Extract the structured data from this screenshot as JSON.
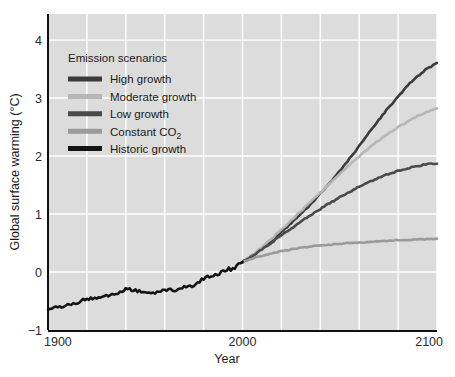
{
  "chart_data": {
    "type": "line",
    "title": "",
    "xlabel": "Year",
    "ylabel": "Global surface warming (°C)",
    "xlim": [
      1900,
      2100
    ],
    "ylim": [
      -1,
      4.45
    ],
    "xticks": [
      1900,
      2000,
      2100
    ],
    "xtick_labels": [
      "1900",
      "2000",
      "2100"
    ],
    "yticks": [
      -1,
      0,
      1,
      2,
      3,
      4
    ],
    "ytick_labels": [
      "−1",
      "0",
      "1",
      "2",
      "3",
      "4"
    ],
    "grid": true,
    "grid_x_step": 20,
    "grid_color": "#ffffff",
    "plot_background": "#dcdcdc",
    "legend_position": "upper-left-inside",
    "legend_title": "Emission scenarios",
    "series": [
      {
        "name": "High growth",
        "color": "#3b3b3b",
        "x_start": 2000,
        "x_end": 2100,
        "end_value": 3.6,
        "x": [
          2000,
          2005,
          2010,
          2015,
          2020,
          2025,
          2030,
          2035,
          2040,
          2045,
          2050,
          2055,
          2060,
          2065,
          2070,
          2075,
          2080,
          2085,
          2090,
          2095,
          2100
        ],
        "values": [
          0.17,
          0.28,
          0.41,
          0.55,
          0.69,
          0.84,
          1.0,
          1.17,
          1.35,
          1.54,
          1.74,
          1.95,
          2.17,
          2.4,
          2.62,
          2.83,
          3.03,
          3.22,
          3.38,
          3.51,
          3.6
        ]
      },
      {
        "name": "Moderate growth",
        "color": "#b6b6b6",
        "x_start": 2000,
        "x_end": 2100,
        "end_value": 2.82,
        "x": [
          2000,
          2005,
          2010,
          2015,
          2020,
          2025,
          2030,
          2035,
          2040,
          2045,
          2050,
          2055,
          2060,
          2065,
          2070,
          2075,
          2080,
          2085,
          2090,
          2095,
          2100
        ],
        "values": [
          0.17,
          0.29,
          0.43,
          0.58,
          0.73,
          0.89,
          1.05,
          1.21,
          1.37,
          1.53,
          1.69,
          1.85,
          2.0,
          2.14,
          2.27,
          2.39,
          2.5,
          2.6,
          2.69,
          2.76,
          2.82
        ]
      },
      {
        "name": "Low growth",
        "color": "#4a4a4a",
        "x_start": 2000,
        "x_end": 2100,
        "end_value": 1.87,
        "x": [
          2000,
          2005,
          2010,
          2015,
          2020,
          2025,
          2030,
          2035,
          2040,
          2045,
          2050,
          2055,
          2060,
          2065,
          2070,
          2075,
          2080,
          2085,
          2090,
          2095,
          2100
        ],
        "values": [
          0.17,
          0.27,
          0.39,
          0.51,
          0.63,
          0.75,
          0.87,
          0.98,
          1.09,
          1.19,
          1.29,
          1.38,
          1.47,
          1.55,
          1.62,
          1.69,
          1.74,
          1.79,
          1.83,
          1.86,
          1.87
        ]
      },
      {
        "name": "Constant CO2",
        "name_display": "Constant CO",
        "subscript": "2",
        "color": "#9a9a9a",
        "x_start": 2000,
        "x_end": 2100,
        "end_value": 0.57,
        "x": [
          2000,
          2005,
          2010,
          2015,
          2020,
          2025,
          2030,
          2035,
          2040,
          2045,
          2050,
          2055,
          2060,
          2065,
          2070,
          2075,
          2080,
          2085,
          2090,
          2095,
          2100
        ],
        "values": [
          0.17,
          0.23,
          0.28,
          0.32,
          0.36,
          0.39,
          0.42,
          0.44,
          0.46,
          0.47,
          0.49,
          0.5,
          0.51,
          0.52,
          0.53,
          0.54,
          0.55,
          0.55,
          0.56,
          0.57,
          0.57
        ]
      },
      {
        "name": "Historic growth",
        "color": "#141414",
        "x_start": 1900,
        "x_end": 2000,
        "end_value": 0.17,
        "x": [
          1900,
          1905,
          1910,
          1915,
          1920,
          1925,
          1930,
          1935,
          1940,
          1945,
          1950,
          1955,
          1960,
          1965,
          1970,
          1975,
          1980,
          1985,
          1990,
          1995,
          2000
        ],
        "values": [
          -0.64,
          -0.6,
          -0.58,
          -0.52,
          -0.48,
          -0.45,
          -0.4,
          -0.38,
          -0.3,
          -0.32,
          -0.34,
          -0.35,
          -0.33,
          -0.3,
          -0.27,
          -0.22,
          -0.12,
          -0.06,
          0.03,
          0.06,
          0.17
        ]
      }
    ]
  },
  "legend": {
    "title": "Emission scenarios",
    "items": [
      {
        "label": "High growth",
        "color": "#3b3b3b"
      },
      {
        "label": "Moderate growth",
        "color": "#b6b6b6"
      },
      {
        "label": "Low growth",
        "color": "#4a4a4a"
      },
      {
        "label": "Constant CO",
        "subscript": "2",
        "color": "#9a9a9a"
      },
      {
        "label": "Historic growth",
        "color": "#141414"
      }
    ]
  },
  "axes": {
    "x_title": "Year",
    "y_title": "Global surface warming (°C)",
    "x_tick_labels": [
      "1900",
      "2000",
      "2100"
    ],
    "y_tick_labels": [
      "−1",
      "0",
      "1",
      "2",
      "3",
      "4"
    ]
  }
}
